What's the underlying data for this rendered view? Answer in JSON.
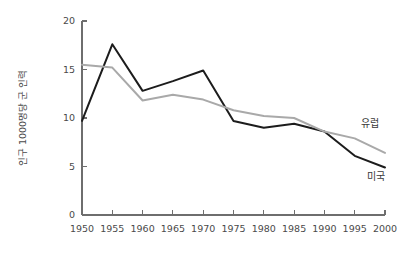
{
  "chart_data": {
    "type": "line",
    "title": "",
    "xlabel": "",
    "ylabel": "인구 1000명당 군 인력",
    "x": [
      1950,
      1955,
      1960,
      1965,
      1970,
      1975,
      1980,
      1985,
      1990,
      1995,
      2000
    ],
    "xtick_labels": [
      "1950",
      "1955",
      "1960",
      "1965",
      "1970",
      "1975",
      "1980",
      "1985",
      "1990",
      "1995",
      "2000"
    ],
    "ytick_labels": [
      "0",
      "5",
      "10",
      "15",
      "20"
    ],
    "yticks": [
      0,
      5,
      10,
      15,
      20
    ],
    "xlim": [
      1950,
      2000
    ],
    "ylim": [
      0,
      20
    ],
    "grid": false,
    "legend_position": "inline-right",
    "series": [
      {
        "name": "미국",
        "color": "#1c1c1c",
        "label_x": 1997,
        "label_y": 3.6,
        "values": [
          9.7,
          17.6,
          12.8,
          13.8,
          14.9,
          9.7,
          9.0,
          9.4,
          8.6,
          6.1,
          4.9
        ]
      },
      {
        "name": "유럽",
        "color": "#a9a9a9",
        "label_x": 1996,
        "label_y": 9.1,
        "values": [
          15.5,
          15.2,
          11.8,
          12.4,
          11.9,
          10.8,
          10.2,
          10.0,
          8.6,
          7.9,
          6.4
        ]
      }
    ]
  },
  "axes": {
    "y_title": "인구 1000명당 군 인력"
  }
}
